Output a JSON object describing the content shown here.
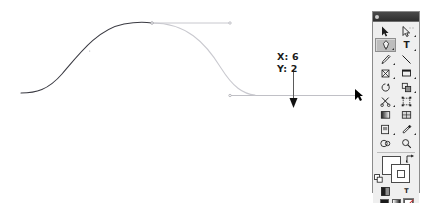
{
  "app": {
    "name": "Adobe Illustrator",
    "document_background": "#ffffff"
  },
  "canvas": {
    "name": "artboard",
    "path": {
      "name": "bezier-s-curve",
      "description": "S-shaped bezier curve being reshaped by dragging a direction handle",
      "drawn_segment_color": "#3a3a42",
      "preview_segment_color": "#c9c9cf",
      "handle_line_color": "#b9b9bf",
      "anchor_point_color": "#9a9aa2"
    },
    "handles": [
      {
        "name": "top-direction-handle",
        "orientation": "horizontal",
        "color": "#c2c2c8"
      },
      {
        "name": "bottom-direction-handle",
        "orientation": "horizontal",
        "color": "#b9b9bf"
      }
    ],
    "drag_arrow": {
      "name": "drag-direction-arrow",
      "direction": "down",
      "color": "#111111"
    },
    "cursor": {
      "name": "selection-cursor",
      "glyph": "arrow",
      "color": "#000000"
    }
  },
  "readout": {
    "name": "coordinate-readout",
    "x_label": "X: 6",
    "y_label": "Y: 2",
    "x_value": 6,
    "y_value": 2,
    "text_color": "#1a1a1a"
  },
  "toolbox": {
    "title": "Tools",
    "close_button": "close-button",
    "grip": "panel-grip",
    "selected_tool": "pen-tool",
    "rows": [
      {
        "cells": [
          {
            "name": "selection-tool",
            "icon": "arrow-solid",
            "selected": false,
            "has_flyout": false
          },
          {
            "name": "direct-selection-tool",
            "icon": "arrow-hollow",
            "selected": false,
            "has_flyout": true
          }
        ]
      },
      {
        "cells": [
          {
            "name": "pen-tool",
            "icon": "pen",
            "selected": true,
            "has_flyout": true
          },
          {
            "name": "type-tool",
            "icon": "letter-T",
            "selected": false,
            "has_flyout": true
          }
        ]
      },
      {
        "cells": [
          {
            "name": "pencil-tool",
            "icon": "pencil",
            "selected": false,
            "has_flyout": true
          },
          {
            "name": "line-segment-tool",
            "icon": "line-diagonal",
            "selected": false,
            "has_flyout": false
          }
        ]
      },
      {
        "cells": [
          {
            "name": "paintbrush-tool",
            "icon": "brush",
            "selected": false,
            "has_flyout": true
          },
          {
            "name": "rectangle-tool",
            "icon": "rectangle",
            "selected": false,
            "has_flyout": true
          }
        ]
      },
      {
        "cells": [
          {
            "name": "rotate-tool",
            "icon": "rotate-circle",
            "selected": false,
            "has_flyout": false
          },
          {
            "name": "scale-tool",
            "icon": "scale-square",
            "selected": false,
            "has_flyout": true
          }
        ]
      },
      {
        "cells": [
          {
            "name": "scissors-tool",
            "icon": "scissors",
            "selected": false,
            "has_flyout": true
          },
          {
            "name": "free-transform-tool",
            "icon": "transform-box",
            "selected": false,
            "has_flyout": false
          }
        ]
      },
      {
        "cells": [
          {
            "name": "gradient-tool",
            "icon": "gradient-square",
            "selected": false,
            "has_flyout": false
          },
          {
            "name": "mesh-tool",
            "icon": "mesh-rectangle",
            "selected": false,
            "has_flyout": false
          }
        ]
      },
      {
        "cells": [
          {
            "name": "symbol-sprayer-tool",
            "icon": "symbol-page",
            "selected": false,
            "has_flyout": true
          },
          {
            "name": "eyedropper-tool",
            "icon": "eyedropper",
            "selected": false,
            "has_flyout": true
          }
        ]
      },
      {
        "cells": [
          {
            "name": "blend-tool",
            "icon": "blend-circles",
            "selected": false,
            "has_flyout": false
          },
          {
            "name": "zoom-tool",
            "icon": "magnifier",
            "selected": false,
            "has_flyout": false
          }
        ]
      }
    ],
    "fill_stroke": {
      "name": "fill-and-stroke-proxy",
      "fill": {
        "name": "fill-swatch",
        "color": "#ffffff"
      },
      "stroke": {
        "name": "stroke-swatch",
        "color": "#ffffff"
      },
      "swap_button": "swap-fill-stroke-icon",
      "defaults_button": "default-fill-stroke-icon"
    },
    "text_mode_row": {
      "cells": [
        {
          "name": "color-mode-button",
          "icon": "color-square",
          "selected": false
        },
        {
          "name": "text-mode-button",
          "icon": "letter-T",
          "selected": false
        }
      ]
    },
    "paint_modes": [
      {
        "name": "color-button",
        "icon": "solid-color",
        "selected": false
      },
      {
        "name": "gradient-button",
        "icon": "gradient",
        "selected": false
      },
      {
        "name": "none-button",
        "icon": "none-slash",
        "selected": true
      }
    ],
    "screen_modes": [
      {
        "name": "standard-screen-mode-button",
        "selected": true
      },
      {
        "name": "full-screen-mode-button",
        "selected": false
      }
    ]
  }
}
